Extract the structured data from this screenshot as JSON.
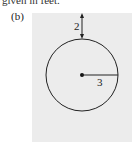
{
  "caption": "given in feet.",
  "part_label": "(b)",
  "figure": {
    "panel_color": "#ececec",
    "stroke_color": "#222222",
    "circle": {
      "cx": 82,
      "cy": 75,
      "r": 36
    },
    "gap_label": "2",
    "radius_label": "3"
  }
}
